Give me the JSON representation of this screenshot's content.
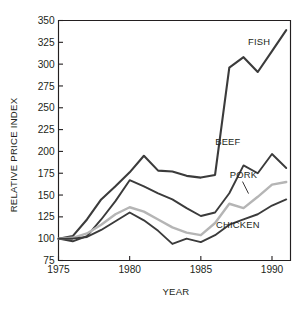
{
  "chart_data": {
    "type": "line",
    "title": "",
    "xlabel": "YEAR",
    "ylabel": "RELATIVE PRICE INDEX",
    "xlim": [
      1975,
      1991.3
    ],
    "ylim": [
      75,
      350
    ],
    "grid": false,
    "legend_position": "inline-labels",
    "x_ticks": [
      1975,
      1980,
      1985,
      1990
    ],
    "x_tick_labels": [
      "1975",
      "1980",
      "1985",
      "1990"
    ],
    "y_ticks": [
      75,
      100,
      125,
      150,
      175,
      200,
      225,
      250,
      275,
      300,
      325,
      350
    ],
    "y_tick_labels": [
      "75",
      "100",
      "125",
      "150",
      "175",
      "200",
      "225",
      "250",
      "275",
      "300",
      "325",
      "350"
    ],
    "x": [
      1975,
      1976,
      1977,
      1978,
      1979,
      1980,
      1981,
      1982,
      1983,
      1984,
      1985,
      1986,
      1987,
      1988,
      1989,
      1990,
      1991
    ],
    "series": [
      {
        "name": "FISH",
        "color": "#3b3b3b",
        "width": 2.1,
        "label_x": 1989.1,
        "label_y": 322,
        "values": [
          100,
          103,
          122,
          145,
          160,
          176,
          195,
          178,
          177,
          172,
          170,
          173,
          296,
          308,
          291,
          315,
          339
        ]
      },
      {
        "name": "BEEF",
        "color": "#3b3b3b",
        "width": 1.9,
        "label_x": 1986.9,
        "label_y": 207,
        "values": [
          100,
          97,
          103,
          122,
          143,
          167,
          160,
          152,
          145,
          135,
          126,
          130,
          152,
          184,
          175,
          197,
          181
        ]
      },
      {
        "name": "PORK",
        "color": "#b5b5b5",
        "width": 2.4,
        "label_x": 1988.0,
        "label_y": 170,
        "values": [
          100,
          101,
          106,
          116,
          128,
          136,
          131,
          122,
          113,
          107,
          104,
          118,
          140,
          135,
          148,
          162,
          165
        ]
      },
      {
        "name": "CHICKEN",
        "color": "#3b3b3b",
        "width": 1.9,
        "label_x": 1987.6,
        "label_y": 112,
        "values": [
          100,
          100,
          102,
          110,
          120,
          130,
          121,
          109,
          94,
          100,
          96,
          104,
          116,
          122,
          128,
          138,
          145
        ]
      }
    ]
  },
  "axes": {
    "y_title": "RELATIVE PRICE INDEX",
    "x_title": "YEAR"
  },
  "labels": {
    "fish": "FISH",
    "beef": "BEEF",
    "pork": "PORK",
    "chicken": "CHICKEN"
  }
}
